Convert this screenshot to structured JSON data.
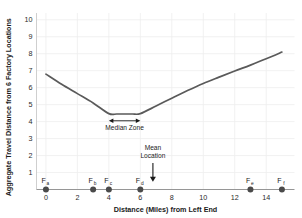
{
  "chart_data": {
    "type": "line",
    "title": "",
    "xlabel": "Distance (Miles) from Left End",
    "ylabel": "Aggregate Travel Distance from 6 Factory Locations",
    "xlim": [
      -0.6,
      15.8
    ],
    "ylim": [
      0,
      10.4
    ],
    "grid": true,
    "legend": "none",
    "x_ticks": [
      "0",
      "2",
      "4",
      "6",
      "8",
      "10",
      "12",
      "14"
    ],
    "x_tick_values": [
      0,
      2,
      4,
      6,
      8,
      10,
      12,
      14
    ],
    "y_ticks": [
      "1",
      "2",
      "3",
      "4",
      "5",
      "6",
      "7",
      "8",
      "9",
      "10"
    ],
    "y_tick_values": [
      1,
      2,
      3,
      4,
      5,
      6,
      7,
      8,
      9,
      10
    ],
    "series": [
      {
        "name": "Aggregate travel distance",
        "color": "#5a5a5a",
        "x": [
          0,
          1,
          2,
          3,
          4,
          4.5,
          5,
          5.5,
          6,
          7,
          8,
          9,
          10,
          11,
          12,
          13,
          14,
          15
        ],
        "values": [
          6.8,
          6.2,
          5.65,
          5.1,
          4.47,
          4.45,
          4.45,
          4.45,
          4.47,
          4.92,
          5.38,
          5.83,
          6.25,
          6.62,
          6.98,
          7.33,
          7.7,
          8.1
        ]
      }
    ],
    "factory_markers": {
      "label_prefix": "F",
      "y_position": 0,
      "points": [
        {
          "label": "F",
          "sub": "a",
          "x": 0
        },
        {
          "label": "F",
          "sub": "b",
          "x": 3
        },
        {
          "label": "F",
          "sub": "c",
          "x": 4
        },
        {
          "label": "F",
          "sub": "d",
          "x": 6
        },
        {
          "label": "F",
          "sub": "e",
          "x": 13
        },
        {
          "label": "F",
          "sub": "f",
          "x": 15
        }
      ]
    },
    "annotations": [
      {
        "name": "median-zone",
        "text": "Median Zone",
        "x_start": 4,
        "x_end": 6,
        "y": 4.05,
        "text_y": 3.5,
        "style": "double-arrow"
      },
      {
        "name": "mean-location",
        "text_line1": "Mean",
        "text_line2": "Location",
        "x": 6.8,
        "y_top": 2.3,
        "y_tip": 0.45,
        "style": "down-arrow"
      }
    ]
  }
}
